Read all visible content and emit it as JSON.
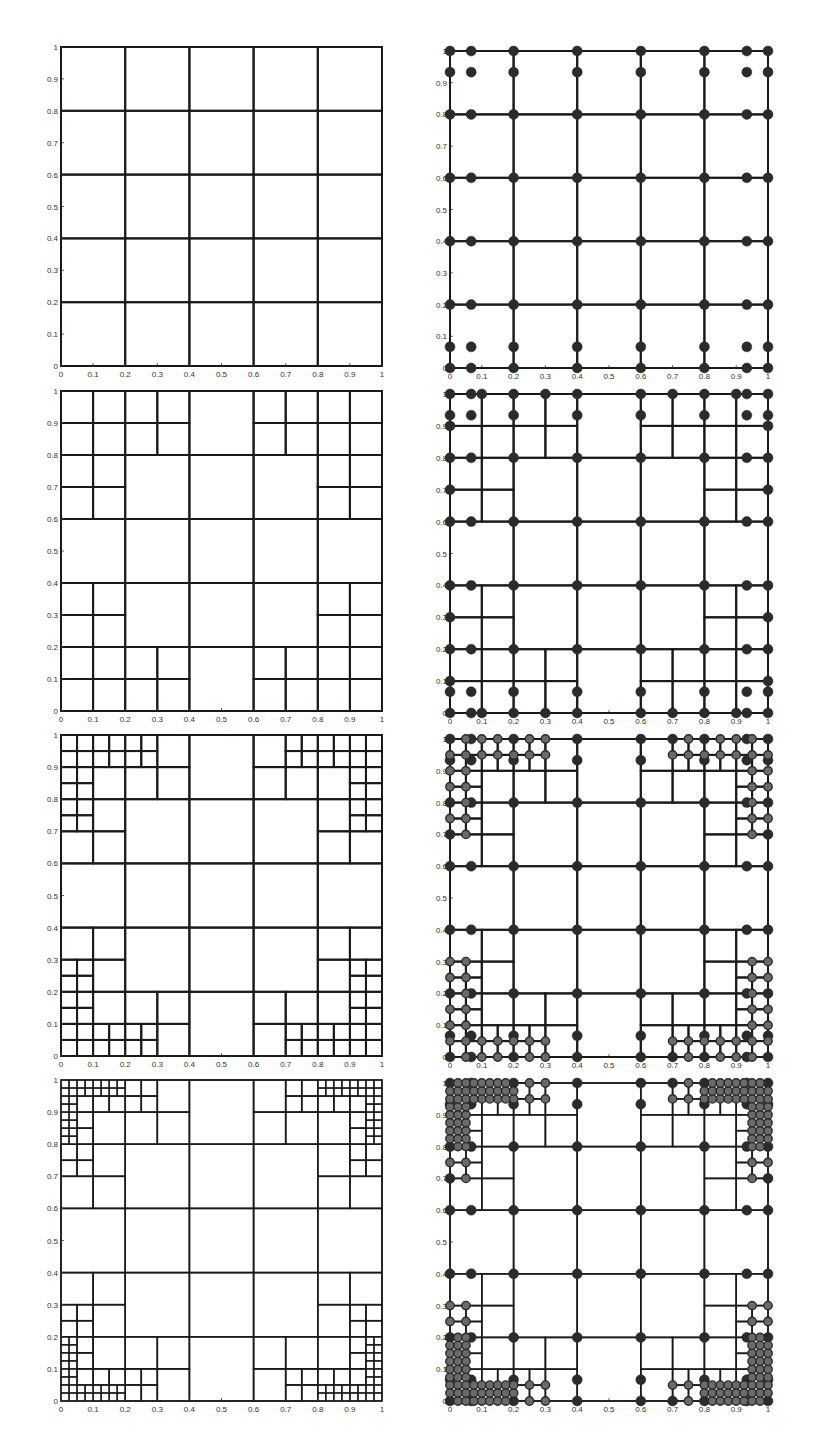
{
  "figure": {
    "line_color": "#1a1a1a",
    "node_color": "#2b2b2b",
    "node_ring_color": "#555555"
  },
  "axes": {
    "xticks": [
      "0",
      "0.1",
      "0.2",
      "0.3",
      "0.4",
      "0.5",
      "0.6",
      "0.7",
      "0.8",
      "0.9",
      "1"
    ],
    "yticks": [
      "0",
      "0.1",
      "0.2",
      "0.3",
      "0.4",
      "0.5",
      "0.6",
      "0.7",
      "0.8",
      "0.9",
      "1"
    ],
    "xlim": [
      0,
      1
    ],
    "ylim": [
      0,
      1
    ]
  },
  "chart_data": [
    {
      "type": "mesh",
      "panel": "row1-left",
      "title": "",
      "base_grid": 0.2,
      "refinement_levels": 0,
      "xlim": [
        0,
        1
      ],
      "ylim": [
        0,
        1
      ],
      "grid": false
    },
    {
      "type": "mesh-nodes",
      "panel": "row1-right",
      "base_grid": 0.2,
      "refinement_levels": 0,
      "xlim": [
        0,
        1
      ],
      "ylim": [
        0,
        1
      ]
    },
    {
      "type": "mesh",
      "panel": "row2-left",
      "base_grid": 0.2,
      "refinement_levels": 1,
      "xlim": [
        0,
        1
      ],
      "ylim": [
        0,
        1
      ]
    },
    {
      "type": "mesh-nodes",
      "panel": "row2-right",
      "base_grid": 0.2,
      "refinement_levels": 1,
      "xlim": [
        0,
        1
      ],
      "ylim": [
        0,
        1
      ]
    },
    {
      "type": "mesh",
      "panel": "row3-left",
      "base_grid": 0.2,
      "refinement_levels": 2,
      "xlim": [
        0,
        1
      ],
      "ylim": [
        0,
        1
      ]
    },
    {
      "type": "mesh-nodes",
      "panel": "row3-right",
      "base_grid": 0.2,
      "refinement_levels": 2,
      "xlim": [
        0,
        1
      ],
      "ylim": [
        0,
        1
      ]
    },
    {
      "type": "mesh",
      "panel": "row4-left",
      "base_grid": 0.2,
      "refinement_levels": 3,
      "xlim": [
        0,
        1
      ],
      "ylim": [
        0,
        1
      ]
    },
    {
      "type": "mesh-nodes",
      "panel": "row4-right",
      "base_grid": 0.2,
      "refinement_levels": 3,
      "xlim": [
        0,
        1
      ],
      "ylim": [
        0,
        1
      ]
    }
  ],
  "refinement_thresholds": [
    0.2,
    0.2,
    0.15
  ],
  "panels": [
    {
      "id": "r1l",
      "x": 61,
      "y": 47,
      "w": 321,
      "h": 319,
      "levels": 0,
      "nodes": false
    },
    {
      "id": "r1r",
      "x": 450,
      "y": 51,
      "w": 318,
      "h": 317,
      "levels": 0,
      "nodes": true
    },
    {
      "id": "r2l",
      "x": 61,
      "y": 391,
      "w": 321,
      "h": 320,
      "levels": 1,
      "nodes": false
    },
    {
      "id": "r2r",
      "x": 450,
      "y": 394,
      "w": 318,
      "h": 319,
      "levels": 1,
      "nodes": true
    },
    {
      "id": "r3l",
      "x": 61,
      "y": 735,
      "w": 321,
      "h": 321,
      "levels": 2,
      "nodes": false
    },
    {
      "id": "r3r",
      "x": 450,
      "y": 739,
      "w": 318,
      "h": 318,
      "levels": 2,
      "nodes": true
    },
    {
      "id": "r4l",
      "x": 61,
      "y": 1080,
      "w": 321,
      "h": 321,
      "levels": 3,
      "nodes": false
    },
    {
      "id": "r4r",
      "x": 450,
      "y": 1083,
      "w": 318,
      "h": 318,
      "levels": 3,
      "nodes": true
    }
  ]
}
